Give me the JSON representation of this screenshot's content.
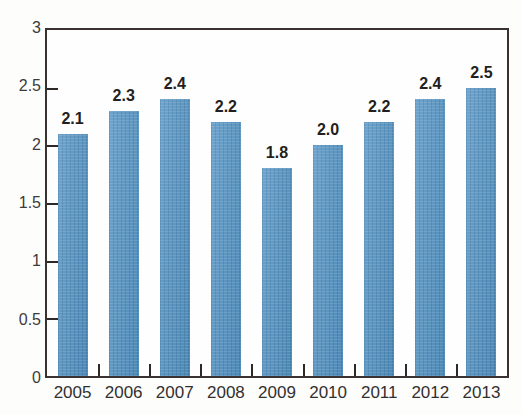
{
  "title_strip": {
    "note": "title cropped off top edge of screenshot; text not legible",
    "ghost_text": ""
  },
  "chart_data": {
    "type": "bar",
    "title": "",
    "xlabel": "",
    "ylabel": "",
    "categories": [
      "2005",
      "2006",
      "2007",
      "2008",
      "2009",
      "2010",
      "2011",
      "2012",
      "2013"
    ],
    "values": [
      2.1,
      2.3,
      2.4,
      2.2,
      1.8,
      2.0,
      2.2,
      2.4,
      2.5
    ],
    "data_labels": [
      "2.1",
      "2.3",
      "2.4",
      "2.2",
      "1.8",
      "2.0",
      "2.2",
      "2.4",
      "2.5"
    ],
    "ylim": [
      0,
      3
    ],
    "y_ticks": [
      0,
      0.5,
      1,
      1.5,
      2,
      2.5,
      3
    ],
    "y_tick_labels": [
      "0",
      "0.5",
      "1",
      "1.5",
      "2",
      "2.5",
      "3"
    ],
    "grid": false,
    "legend": null,
    "bar_color": "#4a8dc0",
    "frame_color": "#3a3230",
    "label_color": "#231f20",
    "tick_label_color": "#32302f"
  }
}
